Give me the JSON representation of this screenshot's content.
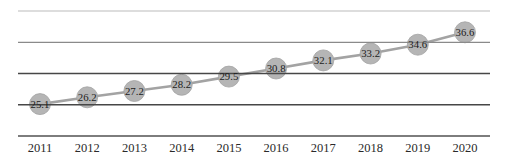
{
  "page": {
    "background": "#ffffff"
  },
  "chart_data": {
    "type": "line",
    "title": "",
    "xlabel": "",
    "ylabel": "",
    "categories": [
      "2011",
      "2012",
      "2013",
      "2014",
      "2015",
      "2016",
      "2017",
      "2018",
      "2019",
      "2020"
    ],
    "series": [
      {
        "name": "series-1",
        "values": [
          25.1,
          26.2,
          27.2,
          28.2,
          29.5,
          30.8,
          32.1,
          33.2,
          34.6,
          36.6
        ],
        "labels": [
          "25.1",
          "26.2",
          "27.2",
          "28.2",
          "29.5",
          "30.8",
          "32.1",
          "33.2",
          "34.6",
          "36.6"
        ]
      }
    ],
    "ylim": [
      20,
      40
    ],
    "grid": true,
    "gridline_values": [
      25,
      30,
      35,
      40
    ],
    "legend_position": "none",
    "colors": {
      "marker_fill": "#b5b5b5",
      "marker_edge": "#a2a2a2",
      "line": "#a3a3a3",
      "label_text": "#1c1c1c",
      "tick_text": "#2a2a2a",
      "axis": "#7d7d7d",
      "gridlines": [
        "#474747",
        "#474747",
        "#8a8a8a",
        "#bcbcbc"
      ]
    }
  }
}
